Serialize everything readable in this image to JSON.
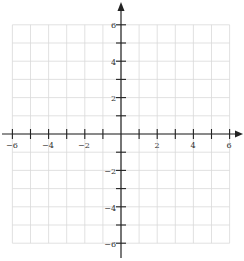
{
  "chart_data": {
    "type": "scatter",
    "title": "",
    "xlabel": "",
    "ylabel": "",
    "xlim": [
      -6,
      6
    ],
    "ylim": [
      -6,
      6
    ],
    "grid": true,
    "grid_step": 1,
    "x_ticks": [
      -6,
      -5,
      -4,
      -3,
      -2,
      -1,
      1,
      2,
      3,
      4,
      5,
      6
    ],
    "y_ticks": [
      -6,
      -5,
      -4,
      -3,
      -2,
      -1,
      1,
      2,
      3,
      4,
      5,
      6
    ],
    "x_tick_labels": [
      "−6",
      "−4",
      "−2",
      "2",
      "4",
      "6"
    ],
    "y_tick_labels": [
      "6",
      "4",
      "2",
      "−2",
      "−4",
      "−6"
    ],
    "series": [],
    "axes_arrows": true,
    "colors": {
      "grid": "#d9d9d9",
      "axis": "#222222",
      "label": "#333333"
    }
  }
}
